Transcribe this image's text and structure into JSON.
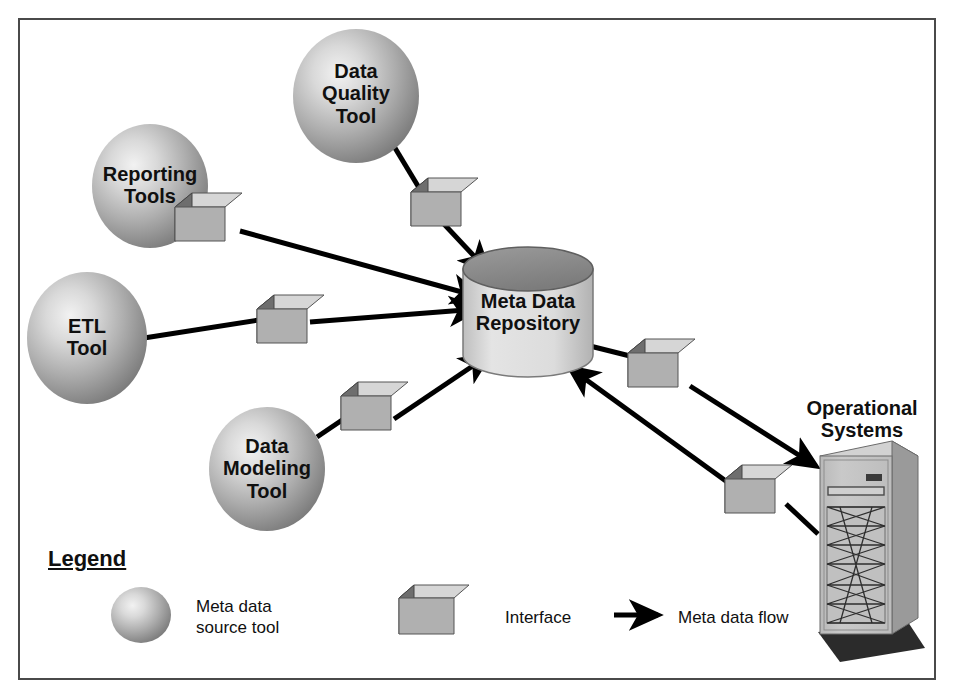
{
  "diagram": {
    "frame": {
      "border_color": "#4a4a4a",
      "background": "#ffffff"
    },
    "palette": {
      "sphere_light": "#e8e8e8",
      "sphere_mid": "#b5b5b5",
      "sphere_dark": "#7d7d7d",
      "cube_top": "#d6d6d6",
      "cube_front": "#b0b0b0",
      "cube_side": "#6e6e6e",
      "cylinder_body": "#dcdcdc",
      "cylinder_top": "#8d8d8d",
      "tower_front": "#c2c2c2",
      "tower_side": "#9a9a9a",
      "line_color": "#000000",
      "text_color": "#101010"
    },
    "nodes": [
      {
        "id": "data-quality-tool",
        "type": "sphere",
        "label": "Data\nQuality\nTool",
        "cx": 356,
        "cy": 96,
        "rx": 63,
        "ry": 67
      },
      {
        "id": "reporting-tools",
        "type": "sphere",
        "label": "Reporting\nTools",
        "cx": 150,
        "cy": 186,
        "rx": 58,
        "ry": 62
      },
      {
        "id": "etl-tool",
        "type": "sphere",
        "label": "ETL\nTool",
        "cx": 87,
        "cy": 338,
        "rx": 60,
        "ry": 66
      },
      {
        "id": "data-modeling-tool",
        "type": "sphere",
        "label": "Data\nModeling\nTool",
        "cx": 267,
        "cy": 469,
        "rx": 58,
        "ry": 62
      },
      {
        "id": "meta-data-repository",
        "type": "cylinder",
        "label": "Meta Data\nRepository",
        "cx": 528,
        "cy": 312
      },
      {
        "id": "operational-systems",
        "type": "tower",
        "label": "Operational\nSystems",
        "cx": 862,
        "cy": 430
      }
    ],
    "interfaces": [
      {
        "id": "interface-data-quality",
        "x": 411,
        "y": 192
      },
      {
        "id": "interface-reporting",
        "x": 175,
        "y": 207
      },
      {
        "id": "interface-etl",
        "x": 257,
        "y": 309
      },
      {
        "id": "interface-data-modeling",
        "x": 341,
        "y": 396
      },
      {
        "id": "interface-repo-to-ops",
        "x": 628,
        "y": 353
      },
      {
        "id": "interface-ops-to-repo",
        "x": 725,
        "y": 479
      }
    ],
    "flows": [
      {
        "id": "flow-data-quality-to-repo",
        "from": "data-quality-tool",
        "to": "meta-data-repository",
        "direction": "to-repository"
      },
      {
        "id": "flow-reporting-to-repo",
        "from": "reporting-tools",
        "to": "meta-data-repository",
        "direction": "to-repository"
      },
      {
        "id": "flow-etl-to-repo",
        "from": "etl-tool",
        "to": "meta-data-repository",
        "direction": "to-repository"
      },
      {
        "id": "flow-data-modeling-to-repo",
        "from": "data-modeling-tool",
        "to": "meta-data-repository",
        "direction": "to-repository"
      },
      {
        "id": "flow-repo-to-operational",
        "from": "meta-data-repository",
        "to": "operational-systems",
        "direction": "to-operational"
      },
      {
        "id": "flow-operational-to-repo",
        "from": "operational-systems",
        "to": "meta-data-repository",
        "direction": "to-repository"
      }
    ]
  },
  "legend": {
    "title": "Legend",
    "items": [
      {
        "id": "legend-sphere",
        "symbol": "sphere",
        "label": "Meta data\nsource tool"
      },
      {
        "id": "legend-cube",
        "symbol": "cube",
        "label": "Interface"
      },
      {
        "id": "legend-arrow",
        "symbol": "arrow",
        "label": "Meta data flow"
      }
    ]
  }
}
